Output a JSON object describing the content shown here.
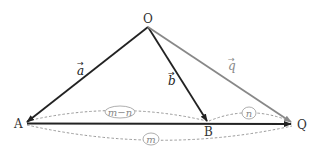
{
  "diagram": {
    "points": {
      "O": {
        "label": "O",
        "x": 148,
        "y": 27
      },
      "A": {
        "label": "A",
        "x": 25,
        "y": 123
      },
      "B": {
        "label": "B",
        "x": 208,
        "y": 123
      },
      "Q": {
        "label": "Q",
        "x": 293,
        "y": 124
      }
    },
    "vectors": {
      "a": {
        "label": "a",
        "arrow": "→",
        "from": "O",
        "to": "A",
        "color": "#222222"
      },
      "b": {
        "label": "b",
        "arrow": "→",
        "from": "O",
        "to": "B",
        "color": "#222222"
      },
      "q": {
        "label": "q",
        "arrow": "→",
        "from": "O",
        "to": "Q",
        "color": "#888888"
      }
    },
    "segment_AQ": {
      "from": "A",
      "to": "Q",
      "color": "#222222"
    },
    "ratio_labels": {
      "AB": "m−n",
      "BQ": "n",
      "AQ": "m"
    },
    "colors": {
      "dark": "#222222",
      "gray": "#888888",
      "dashed": "#999999"
    }
  }
}
